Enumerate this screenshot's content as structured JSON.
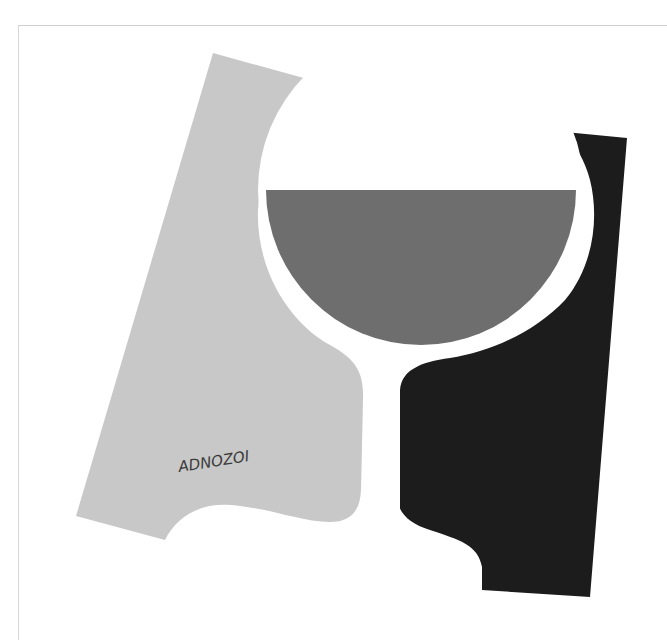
{
  "artwork": {
    "subject": "Stylized wine glass poster",
    "signature": "ADNOZOI",
    "colors": {
      "background": "#ffffff",
      "left_shape": "#c8c8c8",
      "right_shape": "#1c1c1c",
      "wine": "#6e6e6e",
      "frame_line": "#cfcfcf"
    }
  }
}
